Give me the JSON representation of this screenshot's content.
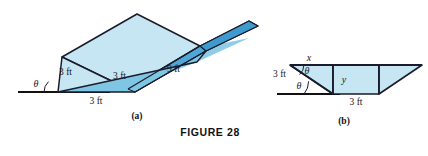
{
  "figure": {
    "caption": "FIGURE 28",
    "panels": [
      {
        "id": "a",
        "label": "(a)"
      },
      {
        "id": "b",
        "label": "(b)"
      }
    ]
  },
  "colors": {
    "light_blue_fill": "#c5e6f2",
    "mid_blue_fill": "#b3dced",
    "dark_blue_fill": "#4ea7d6",
    "deep_blue_fill": "#3f9ace",
    "outline": "#1b1b2b",
    "baseline": "#111111",
    "text": "#1a1a1a",
    "page_background": "#ffffff"
  },
  "panel_a": {
    "description": "Three dimensional view of a sheet-metal rain gutter folded up from a flat strip, resting on a horizontal ground line.",
    "labels": {
      "left_flap_length": "3 ft",
      "right_flap_length": "3 ft",
      "gutter_length": "9 ft",
      "base_width": "3 ft",
      "angle": "θ"
    }
  },
  "panel_b": {
    "description": "Cross-section of the gutter: an isosceles trapezoid with 3 ft sides turned up at angle theta from the 3 ft base.",
    "labels": {
      "top_horizontal_run": "x",
      "side_length": "3 ft",
      "vertical_height": "y",
      "base_width": "3 ft",
      "angle_upper": "θ",
      "angle_lower": "θ"
    }
  }
}
